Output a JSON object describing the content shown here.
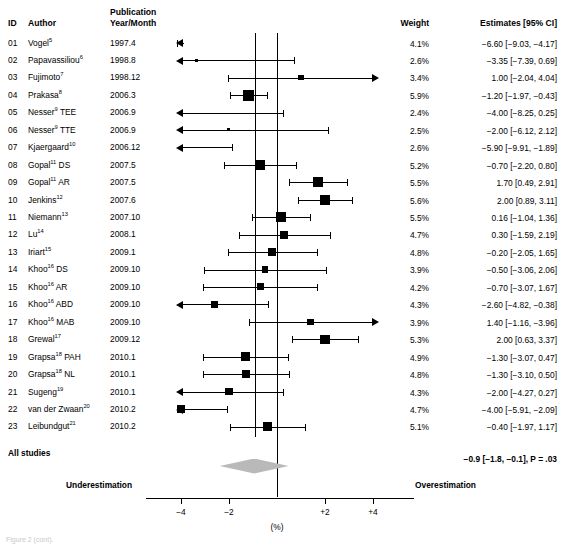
{
  "figure": {
    "type": "forest-plot",
    "columns": {
      "id": "ID",
      "author": "Author",
      "year": "Publication\nYear/Month",
      "year_line1": "Publication",
      "year_line2": "Year/Month",
      "weight": "Weight",
      "estimate": "Estimates [95% CI]"
    },
    "footer": {
      "all_studies": "All studies",
      "pooled_estimate": "−0.9 [−1.8, −0.1], P = .03",
      "left_label": "Underestimation",
      "right_label": "Overestimation"
    },
    "axis": {
      "unit_label": "(%)",
      "ticks": [
        {
          "value": -4,
          "label": "−4"
        },
        {
          "value": -2,
          "label": "−2"
        },
        {
          "value": 0,
          "label": ""
        },
        {
          "value": 2,
          "label": "+2"
        },
        {
          "value": 4,
          "label": "+4"
        }
      ],
      "xmin": -6.3,
      "xmax": 5.6,
      "zero_line": 0,
      "pooled_line": -0.9
    },
    "caption": "Figure 2 (cont)."
  },
  "chart_data": {
    "type": "forest",
    "title": "",
    "xlabel": "(%)",
    "ylabel": "",
    "xlim": [
      -6.3,
      5.6
    ],
    "grid": false,
    "legend": "none",
    "columns": [
      "ID",
      "Author",
      "Publication Year/Month",
      "Weight",
      "Estimates [95% CI]"
    ],
    "pooled": {
      "estimate": -0.9,
      "ci_low": -1.8,
      "ci_high": -0.1,
      "p_value": ".03",
      "label": "All studies",
      "text": "−0.9 [−1.8, −0.1], P = .03"
    },
    "rows": [
      {
        "id": "01",
        "author": "Vogel",
        "ref": "5",
        "year": "1997.4",
        "weight": "4.1%",
        "weight_num": 4.1,
        "estimate": -6.6,
        "ci_low": -9.03,
        "ci_high": -4.17,
        "est_text": "−6.60 [−9.03, −4.17]",
        "clip_left": true,
        "clip_right": false
      },
      {
        "id": "02",
        "author": "Papavassiliou",
        "ref": "6",
        "year": "1998.8",
        "weight": "2.6%",
        "weight_num": 2.6,
        "estimate": -3.35,
        "ci_low": -7.39,
        "ci_high": 0.69,
        "est_text": "−3.35 [−7.39, 0.69]",
        "clip_left": true,
        "clip_right": false
      },
      {
        "id": "03",
        "author": "Fujimoto",
        "ref": "7",
        "year": "1998.12",
        "weight": "3.4%",
        "weight_num": 3.4,
        "estimate": 1.0,
        "ci_low": -2.04,
        "ci_high": 4.04,
        "est_text": "1.00 [−2.04, 4.04]",
        "clip_left": false,
        "clip_right": false
      },
      {
        "id": "04",
        "author": "Prakasa",
        "ref": "8",
        "year": "2006.3",
        "weight": "5.9%",
        "weight_num": 5.9,
        "estimate": -1.2,
        "ci_low": -1.97,
        "ci_high": -0.43,
        "est_text": "−1.20 [−1.97, −0.43]",
        "clip_left": false,
        "clip_right": false
      },
      {
        "id": "05",
        "author": "Nesser",
        "ref": "9",
        "suffix": " TEE",
        "year": "2006.9",
        "weight": "2.4%",
        "weight_num": 2.4,
        "estimate": -4.0,
        "ci_low": -8.25,
        "ci_high": 0.25,
        "est_text": "−4.00 [−8.25, 0.25]",
        "clip_left": true,
        "clip_right": false
      },
      {
        "id": "06",
        "author": "Nesser",
        "ref": "9",
        "suffix": " TTE",
        "year": "2006.9",
        "weight": "2.5%",
        "weight_num": 2.5,
        "estimate": -2.0,
        "ci_low": -6.12,
        "ci_high": 2.12,
        "est_text": "−2.00 [−6.12, 2.12]",
        "clip_left": true,
        "clip_right": false
      },
      {
        "id": "07",
        "author": "Kjaergaard",
        "ref": "10",
        "year": "2006.12",
        "weight": "2.6%",
        "weight_num": 2.6,
        "estimate": -5.9,
        "ci_low": -9.91,
        "ci_high": -1.89,
        "est_text": "−5.90 [−9.91, −1.89]",
        "clip_left": true,
        "clip_right": false
      },
      {
        "id": "08",
        "author": "Gopal",
        "ref": "11",
        "suffix": " DS",
        "year": "2007.5",
        "weight": "5.2%",
        "weight_num": 5.2,
        "estimate": -0.7,
        "ci_low": -2.2,
        "ci_high": 0.8,
        "est_text": "−0.70 [−2.20, 0.80]",
        "clip_left": false,
        "clip_right": false
      },
      {
        "id": "09",
        "author": "Gopal",
        "ref": "11",
        "suffix": " AR",
        "year": "2007.5",
        "weight": "5.5%",
        "weight_num": 5.5,
        "estimate": 1.7,
        "ci_low": 0.49,
        "ci_high": 2.91,
        "est_text": "1.70 [0.49, 2.91]",
        "clip_left": false,
        "clip_right": false
      },
      {
        "id": "10",
        "author": "Jenkins",
        "ref": "12",
        "year": "2007.6",
        "weight": "5.6%",
        "weight_num": 5.6,
        "estimate": 2.0,
        "ci_low": 0.89,
        "ci_high": 3.11,
        "est_text": "2.00 [0.89, 3.11]",
        "clip_left": false,
        "clip_right": false
      },
      {
        "id": "11",
        "author": "Niemann",
        "ref": "13",
        "year": "2007.10",
        "weight": "5.5%",
        "weight_num": 5.5,
        "estimate": 0.16,
        "ci_low": -1.04,
        "ci_high": 1.36,
        "est_text": "0.16 [−1.04, 1.36]",
        "clip_left": false,
        "clip_right": false
      },
      {
        "id": "12",
        "author": "Lu",
        "ref": "14",
        "year": "2008.1",
        "weight": "4.7%",
        "weight_num": 4.7,
        "estimate": 0.3,
        "ci_low": -1.59,
        "ci_high": 2.19,
        "est_text": "0.30 [−1.59, 2.19]",
        "clip_left": false,
        "clip_right": false
      },
      {
        "id": "13",
        "author": "Iriart",
        "ref": "15",
        "year": "2009.1",
        "weight": "4.8%",
        "weight_num": 4.8,
        "estimate": -0.2,
        "ci_low": -2.05,
        "ci_high": 1.65,
        "est_text": "−0.20 [−2.05, 1.65]",
        "clip_left": false,
        "clip_right": false
      },
      {
        "id": "14",
        "author": "Khoo",
        "ref": "16",
        "suffix": " DS",
        "year": "2009.10",
        "weight": "3.9%",
        "weight_num": 3.9,
        "estimate": -0.5,
        "ci_low": -3.06,
        "ci_high": 2.06,
        "est_text": "−0.50 [−3.06, 2.06]",
        "clip_left": false,
        "clip_right": false
      },
      {
        "id": "15",
        "author": "Khoo",
        "ref": "16",
        "suffix": " AR",
        "year": "2009.10",
        "weight": "4.2%",
        "weight_num": 4.2,
        "estimate": -0.7,
        "ci_low": -3.07,
        "ci_high": 1.67,
        "est_text": "−0.70 [−3.07, 1.67]",
        "clip_left": false,
        "clip_right": false
      },
      {
        "id": "16",
        "author": "Khoo",
        "ref": "16",
        "suffix": " ABD",
        "year": "2009.10",
        "weight": "4.3%",
        "weight_num": 4.3,
        "estimate": -2.6,
        "ci_low": -4.82,
        "ci_high": -0.38,
        "est_text": "−2.60 [−4.82, −0.38]",
        "clip_left": false,
        "clip_right": false
      },
      {
        "id": "17",
        "author": "Khoo",
        "ref": "16",
        "suffix": " MAB",
        "year": "2009.10",
        "weight": "3.9%",
        "weight_num": 3.9,
        "estimate": 1.4,
        "ci_low": -1.16,
        "ci_high": 3.96,
        "est_text": "1.40 [−1.16, −3.96]",
        "clip_left": false,
        "clip_right": false
      },
      {
        "id": "18",
        "author": "Grewal",
        "ref": "17",
        "year": "2009.12",
        "weight": "5.3%",
        "weight_num": 5.3,
        "estimate": 2.0,
        "ci_low": 0.63,
        "ci_high": 3.37,
        "est_text": "2.00 [0.63, 3.37]",
        "clip_left": false,
        "clip_right": false
      },
      {
        "id": "19",
        "author": "Grapsa",
        "ref": "18",
        "suffix": " PAH",
        "year": "2010.1",
        "weight": "4.9%",
        "weight_num": 4.9,
        "estimate": -1.3,
        "ci_low": -3.07,
        "ci_high": 0.47,
        "est_text": "−1.30 [−3.07, 0.47]",
        "clip_left": false,
        "clip_right": false
      },
      {
        "id": "20",
        "author": "Grapsa",
        "ref": "18",
        "suffix": " NL",
        "year": "2010.1",
        "weight": "4.8%",
        "weight_num": 4.8,
        "estimate": -1.3,
        "ci_low": -3.1,
        "ci_high": 0.5,
        "est_text": "−1.30 [−3.10, 0.50]",
        "clip_left": false,
        "clip_right": false
      },
      {
        "id": "21",
        "author": "Sugeng",
        "ref": "19",
        "year": "2010.1",
        "weight": "4.3%",
        "weight_num": 4.3,
        "estimate": -2.0,
        "ci_low": -4.27,
        "ci_high": 0.27,
        "est_text": "−2.00 [−4.27, 0.27]",
        "clip_left": false,
        "clip_right": false
      },
      {
        "id": "22",
        "author": "van der Zwaan",
        "ref": "20",
        "year": "2010.2",
        "weight": "4.7%",
        "weight_num": 4.7,
        "estimate": -4.0,
        "ci_low": -5.91,
        "ci_high": -2.09,
        "est_text": "−4.00 [−5.91, −2.09]",
        "clip_left": true,
        "clip_right": false
      },
      {
        "id": "23",
        "author": "Leibundgut",
        "ref": "21",
        "year": "2010.2",
        "weight": "5.1%",
        "weight_num": 5.1,
        "estimate": -0.4,
        "ci_low": -1.97,
        "ci_high": 1.17,
        "est_text": "−0.40 [−1.97, 1.17]",
        "clip_left": false,
        "clip_right": false
      }
    ]
  }
}
